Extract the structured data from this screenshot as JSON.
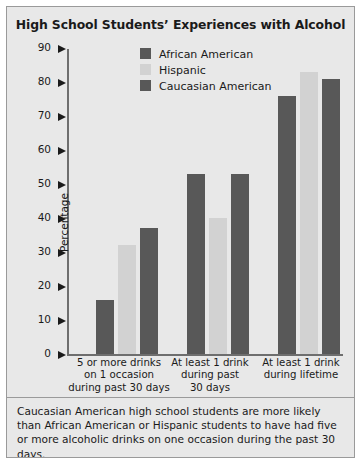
{
  "chart_data": {
    "type": "bar",
    "title": "High School Students’ Experiences with Alcohol",
    "xlabel": "",
    "ylabel": "Percentage",
    "ylim": [
      0,
      90
    ],
    "yticks": [
      0,
      10,
      20,
      30,
      40,
      50,
      60,
      70,
      80,
      90
    ],
    "ytick_labels": [
      "0",
      "10",
      "20",
      "30",
      "40",
      "50",
      "60",
      "70",
      "80",
      "90"
    ],
    "grid": false,
    "legend_position": "top-center",
    "categories": [
      "5 or more drinks on 1 occasion during past 30 days",
      "At least 1 drink during past 30 days",
      "At least 1 drink during lifetime"
    ],
    "category_lines": [
      [
        "5 or more drinks",
        "on 1 occasion",
        "during past 30 days"
      ],
      [
        "At least 1 drink",
        "during past",
        "30 days"
      ],
      [
        "At least 1 drink",
        "during lifetime"
      ]
    ],
    "series": [
      {
        "name": "African American",
        "color": "#585858",
        "values": [
          16,
          53,
          76
        ]
      },
      {
        "name": "Hispanic",
        "color": "#d2d2d2",
        "values": [
          32,
          40,
          83
        ]
      },
      {
        "name": "Caucasian American",
        "color": "#585858",
        "values": [
          37,
          53,
          81
        ]
      }
    ]
  },
  "caption": {
    "text": "Caucasian American high school students are more likely than African American or Hispanic students to have had five or more alcoholic drinks on one occasion during the past 30 days."
  },
  "colors": {
    "dark_gray": "#585858",
    "light_gray": "#d2d2d2",
    "panel_background": "#e8e8e8",
    "border": "#9a9a9a",
    "text": "#1a1a1a"
  }
}
